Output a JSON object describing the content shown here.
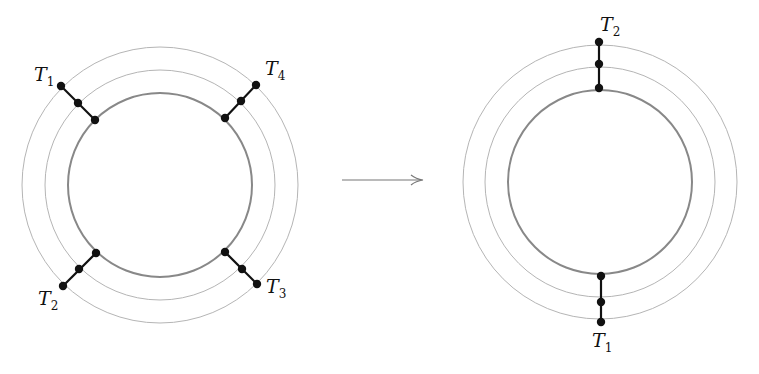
{
  "left_diagram": {
    "labels": [
      {
        "name": "T",
        "sub": "1"
      },
      {
        "name": "T",
        "sub": "4"
      },
      {
        "name": "T",
        "sub": "2"
      },
      {
        "name": "T",
        "sub": "3"
      }
    ]
  },
  "right_diagram": {
    "labels": [
      {
        "name": "T",
        "sub": "2"
      },
      {
        "name": "T",
        "sub": "1"
      }
    ]
  },
  "arrow": "→"
}
